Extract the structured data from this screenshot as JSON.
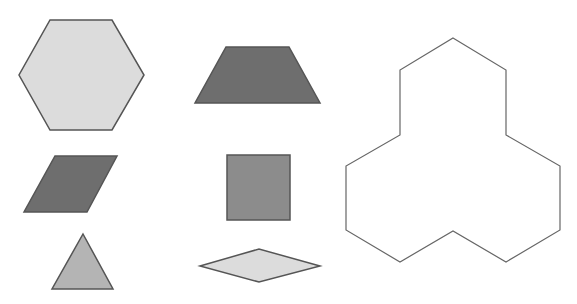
{
  "canvas": {
    "width": 577,
    "height": 304,
    "background": "#ffffff"
  },
  "colors": {
    "light": "#dcdcdc",
    "medium": "#a9a9a9",
    "mediumDark": "#8a8a8a",
    "dark": "#6e6e6e",
    "stroke": "#555555",
    "outline": "#666666"
  },
  "shapes": [
    {
      "id": "hexagon",
      "points": "50,20 112,20 144,75 112,130 50,130 19,75",
      "fill": "#dcdcdc"
    },
    {
      "id": "parallelogram",
      "points": "55,156 117,156 87,212 24,212",
      "fill": "#6e6e6e"
    },
    {
      "id": "triangle",
      "points": "83,234 113,289 52,289",
      "fill": "#b4b4b4"
    },
    {
      "id": "trapezoid",
      "points": "226,47 289,47 320,103 195,103",
      "fill": "#6e6e6e"
    },
    {
      "id": "square",
      "points": "227,155 290,155 290,220 227,220",
      "fill": "#8c8c8c"
    },
    {
      "id": "rhombus",
      "points": "200,266 259,249 320,266 259,282",
      "fill": "#dcdcdc"
    },
    {
      "id": "target-outline",
      "points": "453,38 506,70 506,135 560,166 560,230 506,262 453,231 400,262 346,230 346,166 400,135 400,70",
      "fill": "none"
    }
  ]
}
